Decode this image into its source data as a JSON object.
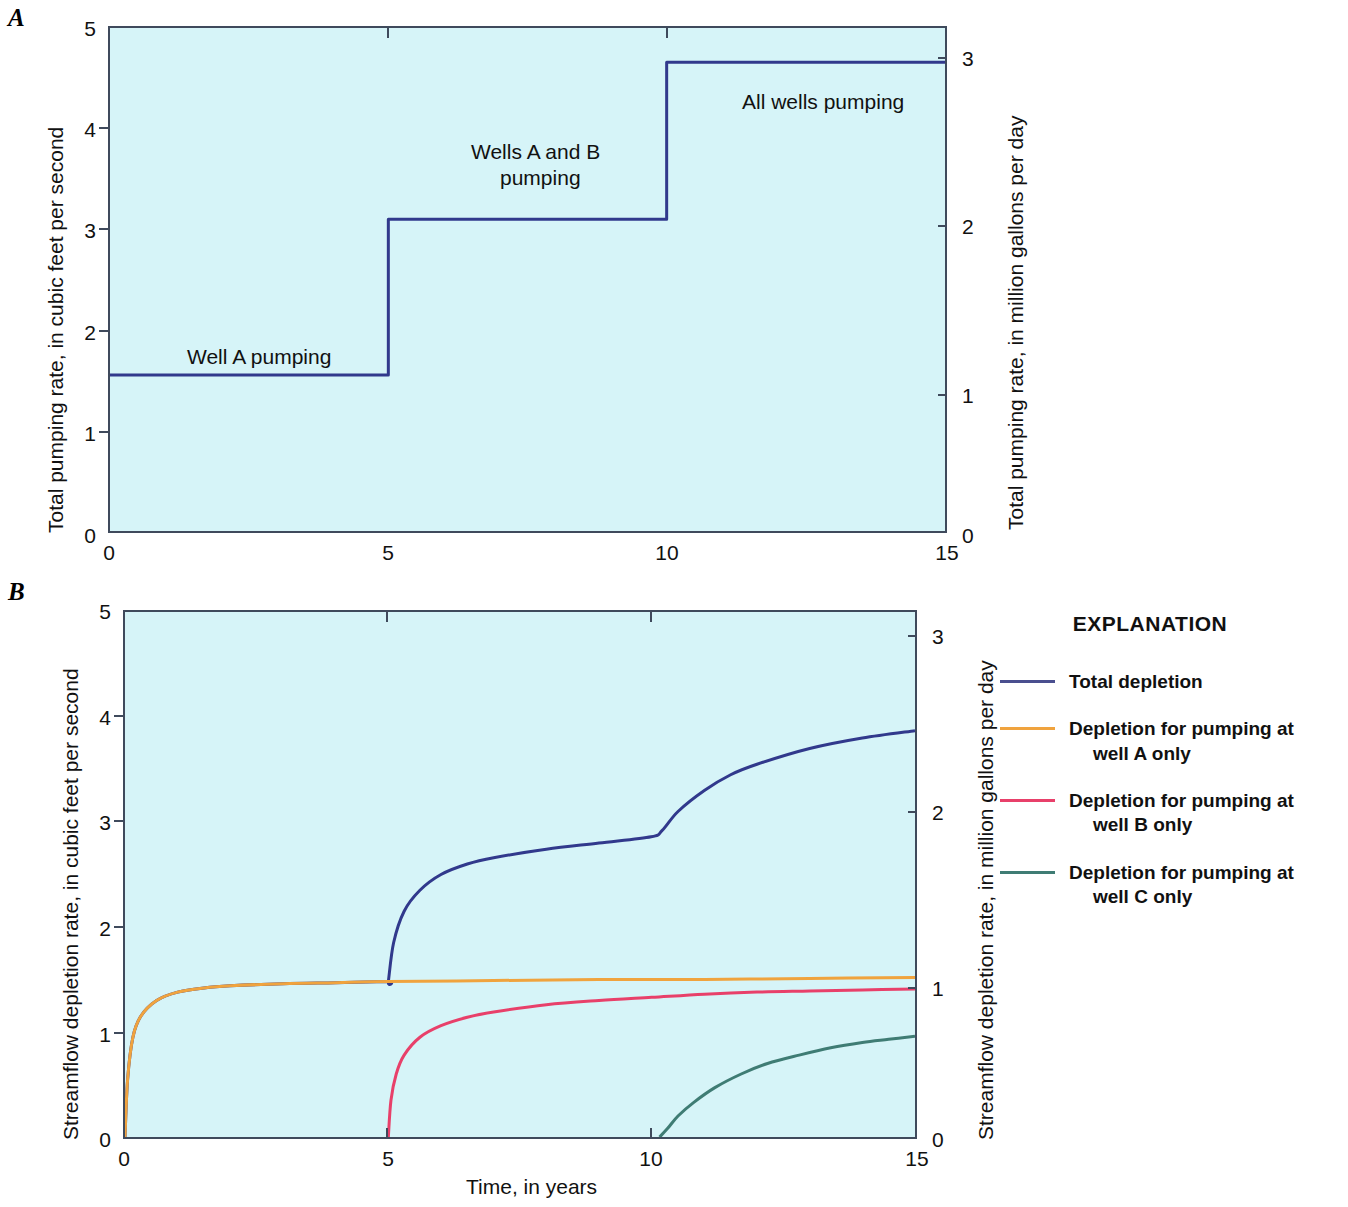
{
  "figure": {
    "panel_a_letter": "A",
    "panel_b_letter": "B",
    "xlabel": "Time, in years"
  },
  "panel_a": {
    "left_axis_title": "Total pumping rate, in cubic feet per second",
    "right_axis_title": "Total pumping rate, in million gallons per day",
    "left_ticks": [
      "5",
      "4",
      "3",
      "2",
      "1",
      "0"
    ],
    "right_ticks": [
      "3",
      "2",
      "1",
      "0"
    ],
    "x_ticks": [
      "0",
      "5",
      "10",
      "15"
    ],
    "annotations": {
      "well_a": "Well A pumping",
      "wells_ab_line1": "Wells A and B",
      "wells_ab_line2": "pumping",
      "all_wells": "All wells pumping"
    }
  },
  "panel_b": {
    "left_axis_title": "Streamflow depletion rate, in cubic feet per second",
    "right_axis_title": "Streamflow depletion rate, in million gallons per day",
    "left_ticks": [
      "5",
      "4",
      "3",
      "2",
      "1",
      "0"
    ],
    "right_ticks": [
      "3",
      "2",
      "1",
      "0"
    ],
    "x_ticks": [
      "0",
      "5",
      "10",
      "15"
    ]
  },
  "legend": {
    "title": "EXPLANATION",
    "items": [
      {
        "label": "Total depletion",
        "label2": "",
        "color": "#4a4f8f"
      },
      {
        "label": "Depletion for pumping at",
        "label2": "well A only",
        "color": "#f0a33e"
      },
      {
        "label": "Depletion for pumping at",
        "label2": "well B only",
        "color": "#e8406a"
      },
      {
        "label": "Depletion for pumping at",
        "label2": "well C only",
        "color": "#3f7c74"
      }
    ]
  },
  "colors": {
    "plot_background": "#d6f4f8",
    "axis": "#3f4a5c",
    "total_depletion": "#31398c",
    "well_a": "#f0a33e",
    "well_b": "#e8406a",
    "well_c": "#3f7c74"
  },
  "chart_data": [
    {
      "type": "line",
      "title": "A",
      "xlabel": "Time, in years",
      "ylabel": "Total pumping rate, in cubic feet per second",
      "ylabel_right": "Total pumping rate, in million gallons per day",
      "xlim": [
        0,
        15
      ],
      "ylim": [
        0,
        5
      ],
      "ylim_right": [
        0,
        3
      ],
      "xticks": [
        0,
        5,
        10,
        15
      ],
      "yticks": [
        0,
        1,
        2,
        3,
        4,
        5
      ],
      "yticks_right": [
        0,
        1,
        2,
        3
      ],
      "grid": false,
      "legend": "none",
      "series": [
        {
          "name": "Total pumping rate",
          "style": "step",
          "color": "#31398c",
          "x": [
            0,
            5,
            5,
            10,
            10,
            15
          ],
          "values": [
            1.55,
            1.55,
            3.1,
            3.1,
            4.66,
            4.66
          ]
        }
      ],
      "annotations": [
        {
          "text": "Well A pumping",
          "x": 2.5,
          "y": 1.95
        },
        {
          "text": "Wells A and B pumping",
          "x": 7.5,
          "y": 4.05
        },
        {
          "text": "All wells pumping",
          "x": 12.3,
          "y": 4.6
        }
      ]
    },
    {
      "type": "line",
      "title": "B",
      "xlabel": "Time, in years",
      "ylabel": "Streamflow depletion rate, in cubic feet per second",
      "ylabel_right": "Streamflow depletion rate, in million gallons per day",
      "xlim": [
        0,
        15
      ],
      "ylim": [
        0,
        5
      ],
      "ylim_right": [
        0,
        3
      ],
      "xticks": [
        0,
        5,
        10,
        15
      ],
      "yticks": [
        0,
        1,
        2,
        3,
        4,
        5
      ],
      "yticks_right": [
        0,
        1,
        2,
        3
      ],
      "grid": false,
      "legend": "right",
      "series": [
        {
          "name": "Total depletion",
          "color": "#31398c",
          "x": [
            0,
            0.05,
            0.15,
            0.3,
            0.6,
            1,
            1.5,
            2,
            3,
            4,
            4.99,
            5.0,
            5.1,
            5.3,
            5.6,
            6,
            6.5,
            7,
            8,
            9,
            9.99,
            10.2,
            10.5,
            11,
            11.5,
            12,
            13,
            14,
            15
          ],
          "values": [
            0,
            0.55,
            0.95,
            1.15,
            1.3,
            1.38,
            1.42,
            1.44,
            1.46,
            1.47,
            1.48,
            1.48,
            1.85,
            2.15,
            2.35,
            2.5,
            2.6,
            2.66,
            2.74,
            2.8,
            2.86,
            2.92,
            3.1,
            3.3,
            3.45,
            3.55,
            3.7,
            3.8,
            3.87
          ]
        },
        {
          "name": "Depletion for pumping at well A only",
          "color": "#f0a33e",
          "x": [
            0,
            0.05,
            0.15,
            0.3,
            0.6,
            1,
            1.5,
            2,
            3,
            4,
            5,
            7,
            9,
            11,
            13,
            15
          ],
          "values": [
            0,
            0.55,
            0.95,
            1.15,
            1.3,
            1.38,
            1.42,
            1.44,
            1.46,
            1.47,
            1.48,
            1.49,
            1.5,
            1.5,
            1.51,
            1.52
          ]
        },
        {
          "name": "Depletion for pumping at well B only",
          "color": "#e8406a",
          "x": [
            5,
            5.05,
            5.15,
            5.3,
            5.6,
            6,
            6.5,
            7,
            8,
            9,
            10,
            11,
            12,
            13,
            14,
            15
          ],
          "values": [
            0,
            0.35,
            0.6,
            0.78,
            0.95,
            1.06,
            1.14,
            1.19,
            1.26,
            1.3,
            1.33,
            1.36,
            1.38,
            1.39,
            1.4,
            1.41
          ]
        },
        {
          "name": "Depletion for pumping at well C only",
          "color": "#3f7c74",
          "x": [
            10.15,
            10.3,
            10.5,
            10.8,
            11.2,
            11.7,
            12.2,
            12.8,
            13.4,
            14,
            14.5,
            15
          ],
          "values": [
            0,
            0.08,
            0.2,
            0.33,
            0.47,
            0.6,
            0.7,
            0.78,
            0.85,
            0.9,
            0.93,
            0.96
          ]
        }
      ]
    }
  ]
}
